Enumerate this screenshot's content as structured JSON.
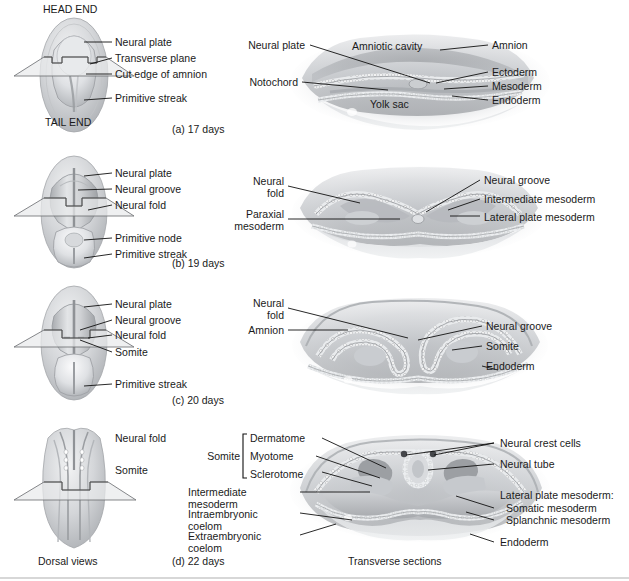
{
  "figure": {
    "orientation_labels": {
      "head": "HEAD END",
      "tail": "TAIL END"
    },
    "column_captions": {
      "left": "Dorsal views",
      "right": "Transverse sections"
    },
    "palette": {
      "ink": "#1a1a1a",
      "leader": "#111111",
      "plane_fill": "#e9eaec",
      "plane_stroke": "#6f7175",
      "tissue_dark": "#8e9094",
      "tissue_mid": "#b9bcc0",
      "tissue_light": "#dcdee1",
      "background": "#ffffff"
    },
    "panels": [
      {
        "id": "a",
        "caption": "(a) 17 days",
        "dorsal_labels": [
          "Neural plate",
          "Transverse plane",
          "Cut edge of amnion",
          "Primitive streak"
        ],
        "section_labels_left": [
          "Neural plate",
          "Notochord"
        ],
        "section_labels_inside": [
          "Amniotic cavity",
          "Yolk sac"
        ],
        "section_labels_right": [
          "Amnion",
          "Ectoderm",
          "Mesoderm",
          "Endoderm"
        ]
      },
      {
        "id": "b",
        "caption": "(b) 19 days",
        "dorsal_labels": [
          "Neural plate",
          "Neural groove",
          "Neural fold",
          "Primitive node",
          "Primitive streak"
        ],
        "section_labels_left": [
          "Neural\nfold",
          "Paraxial\nmesoderm"
        ],
        "section_labels_inside": [],
        "section_labels_right": [
          "Neural groove",
          "Intermediate mesoderm",
          "Lateral plate mesoderm"
        ]
      },
      {
        "id": "c",
        "caption": "(c) 20 days",
        "dorsal_labels": [
          "Neural plate",
          "Neural groove",
          "Neural fold",
          "Somite",
          "Primitive streak"
        ],
        "section_labels_left": [
          "Neural\nfold",
          "Amnion"
        ],
        "section_labels_inside": [],
        "section_labels_right": [
          "Neural groove",
          "Somite",
          "Endoderm"
        ]
      },
      {
        "id": "d",
        "caption": "(d) 22 days",
        "dorsal_labels": [
          "Neural fold",
          "Somite"
        ],
        "section_bracket_group": "Somite",
        "section_bracket_items": [
          "Dermatome",
          "Myotome",
          "Sclerotome"
        ],
        "section_labels_left": [
          "Intermediate\nmesoderm",
          "Intraembryonic\ncoelom",
          "Extraembryonic\ncoelom"
        ],
        "section_labels_right": [
          "Neural crest cells",
          "Neural tube",
          "Lateral plate mesoderm:",
          "Somatic mesoderm",
          "Splanchnic mesoderm",
          "Endoderm"
        ]
      }
    ]
  }
}
